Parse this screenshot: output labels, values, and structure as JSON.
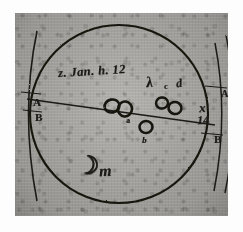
{
  "figure": {
    "kind": "astronomical-observation-sketch",
    "medium": "ink on paper, photographic halftone reproduction",
    "paper_color": "#a9a7a3",
    "ink_color": "#1c1a18",
    "plate_border_color": "#ffffff"
  },
  "annotations": {
    "date_note": "z. Jan. h. 12",
    "greek_label": "λ",
    "label_c": "c",
    "label_d": "d",
    "label_a": "a",
    "label_b": "b",
    "label_x": "x",
    "label_14": "14",
    "arc_left_top": "A",
    "arc_left_bottom": "B",
    "arc_right_top": "A",
    "arc_right_bottom": "B",
    "arc_right_glyph": "6",
    "moon_symbol": "☽",
    "moon_suffix": "m"
  },
  "geometry": {
    "main_circle": {
      "cx": 104,
      "cy": 101,
      "r": 89,
      "stroke": "#18160f",
      "stroke_width": 2.0
    },
    "diameter_chord": {
      "x1": 12,
      "y1": 86,
      "x2": 198,
      "y2": 110,
      "stroke_width": 1.3
    },
    "left_arc": {
      "cx": -38,
      "cy": 100,
      "r": 60
    },
    "right_arc_inner": {
      "cx": 268,
      "cy": 100,
      "r": 68
    },
    "right_arc_outer": {
      "cx": 288,
      "cy": 100,
      "r": 78
    }
  },
  "moons": [
    {
      "name": "moon-cluster-left-1",
      "cx": 97,
      "cy": 93,
      "rx": 7.5,
      "ry": 6.5,
      "rot": -12
    },
    {
      "name": "moon-cluster-left-2",
      "cx": 110,
      "cy": 96,
      "rx": 7.0,
      "ry": 7.5,
      "rot": 6
    },
    {
      "name": "moon-cluster-right-1",
      "cx": 147,
      "cy": 90,
      "rx": 6.0,
      "ry": 5.5,
      "rot": -8
    },
    {
      "name": "moon-cluster-right-2",
      "cx": 160,
      "cy": 95,
      "rx": 6.5,
      "ry": 6.0,
      "rot": 10
    },
    {
      "name": "moon-on-chord",
      "cx": 131,
      "cy": 114,
      "rx": 6.5,
      "ry": 6.0,
      "rot": -4
    }
  ]
}
